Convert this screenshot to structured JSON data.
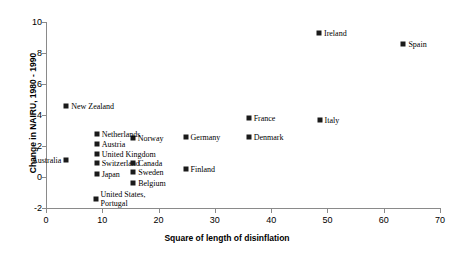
{
  "chart_data": {
    "type": "scatter",
    "title": "",
    "xlabel": "Square of length of disinflation",
    "ylabel": "Change in NAIRU, 1980 - 1990",
    "xlim": [
      0,
      70
    ],
    "ylim": [
      -2,
      10
    ],
    "xticks": [
      0,
      10,
      20,
      30,
      40,
      50,
      60,
      70
    ],
    "yticks": [
      -2,
      0,
      2,
      4,
      6,
      8,
      10
    ],
    "grid": false,
    "legend": "none",
    "marker": "filled-square",
    "marker_color": "#1a1a1a",
    "points": [
      {
        "label": "Ireland",
        "x": 48.5,
        "y": 9.3,
        "side": "right"
      },
      {
        "label": "Spain",
        "x": 63.5,
        "y": 8.6,
        "side": "right"
      },
      {
        "label": "New Zealand",
        "x": 3.6,
        "y": 4.6,
        "side": "right"
      },
      {
        "label": "France",
        "x": 36.0,
        "y": 3.8,
        "side": "right"
      },
      {
        "label": "Italy",
        "x": 48.6,
        "y": 3.7,
        "side": "right"
      },
      {
        "label": "Denmark",
        "x": 36.0,
        "y": 2.6,
        "side": "right"
      },
      {
        "label": "Germany",
        "x": 24.8,
        "y": 2.6,
        "side": "right"
      },
      {
        "label": "Norway",
        "x": 15.4,
        "y": 2.5,
        "side": "right"
      },
      {
        "label": "Netherlands",
        "x": 9.0,
        "y": 2.8,
        "side": "right"
      },
      {
        "label": "Austria",
        "x": 9.0,
        "y": 2.1,
        "side": "right"
      },
      {
        "label": "United Kingdom",
        "x": 9.0,
        "y": 1.5,
        "side": "right"
      },
      {
        "label": "Switzerland",
        "x": 9.0,
        "y": 0.9,
        "side": "right"
      },
      {
        "label": "Japan",
        "x": 9.0,
        "y": 0.2,
        "side": "right"
      },
      {
        "label": "Australia",
        "x": 3.6,
        "y": 1.1,
        "side": "left"
      },
      {
        "label": "Canada",
        "x": 15.5,
        "y": 0.9,
        "side": "right"
      },
      {
        "label": "Sweden",
        "x": 15.5,
        "y": 0.3,
        "side": "right"
      },
      {
        "label": "Belgium",
        "x": 15.5,
        "y": -0.4,
        "side": "right"
      },
      {
        "label": "Finland",
        "x": 24.8,
        "y": 0.5,
        "side": "right"
      },
      {
        "label": "United States,\nPortugal",
        "x": 8.8,
        "y": -1.4,
        "side": "right"
      }
    ]
  }
}
